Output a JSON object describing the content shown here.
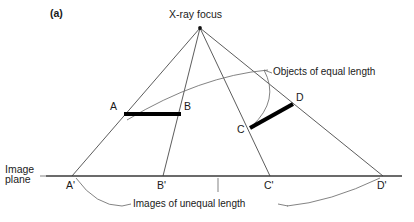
{
  "figure": {
    "panel_label": "(a)",
    "focus_label": "X-ray focus",
    "image_plane_label_line1": "Image",
    "image_plane_label_line2": "plane",
    "objects_annotation": "Objects of equal length",
    "images_annotation": "Images of unequal length",
    "colors": {
      "ray": "#4a4a4a",
      "plane": "#3a3a3a",
      "object_bar": "#000000",
      "arc": "#6d6d6d",
      "text": "#1a1a1a",
      "background": "#ffffff"
    }
  },
  "points": {
    "focus": {
      "label": "X-ray focus",
      "x": 200,
      "y": 28
    },
    "A": {
      "label": "A",
      "x": 124,
      "y": 114
    },
    "B": {
      "label": "B",
      "x": 181,
      "y": 114
    },
    "C": {
      "label": "C",
      "x": 250,
      "y": 128
    },
    "D": {
      "label": "D",
      "x": 293,
      "y": 104
    },
    "Ap": {
      "label": "A'",
      "x": 72,
      "y": 176
    },
    "Bp": {
      "label": "B'",
      "x": 163,
      "y": 176
    },
    "Cp": {
      "label": "C'",
      "x": 270,
      "y": 176
    },
    "Dp": {
      "label": "D'",
      "x": 383,
      "y": 176
    }
  },
  "objects": [
    {
      "name": "object-ab",
      "from": "A",
      "to": "B",
      "length_label": "equal"
    },
    {
      "name": "object-cd",
      "from": "C",
      "to": "D",
      "length_label": "equal"
    }
  ],
  "images": [
    {
      "name": "image-ab",
      "from": "A'",
      "to": "B'",
      "length_label": "unequal"
    },
    {
      "name": "image-cd",
      "from": "C'",
      "to": "D'",
      "length_label": "unequal"
    }
  ]
}
